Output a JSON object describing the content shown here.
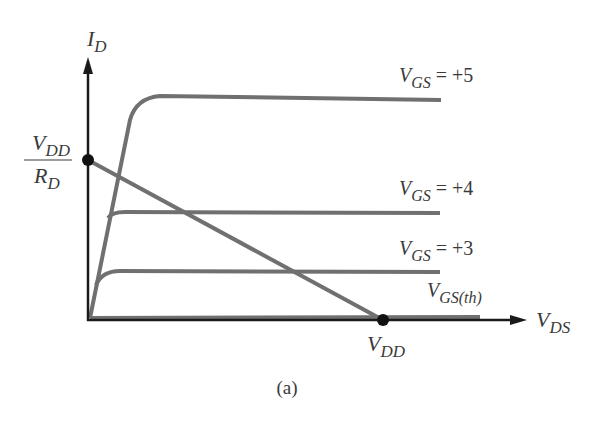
{
  "figure": {
    "caption": "(a)",
    "axes": {
      "y_label": {
        "main": "I",
        "sub": "D"
      },
      "x_label": {
        "main": "V",
        "sub": "DS"
      }
    },
    "load_line": {
      "y_intercept_label": {
        "num_main": "V",
        "num_sub": "DD",
        "den_main": "R",
        "den_sub": "D"
      },
      "x_intercept_label": {
        "main": "V",
        "sub": "DD"
      }
    },
    "curves": [
      {
        "main": "V",
        "sub": "GS",
        "eq": " = +5"
      },
      {
        "main": "V",
        "sub": "GS",
        "eq": " = +4"
      },
      {
        "main": "V",
        "sub": "GS",
        "eq": " = +3"
      },
      {
        "main": "V",
        "sub": "GS(th)",
        "eq": ""
      }
    ],
    "colors": {
      "curve": "#707070",
      "axis": "#1a1a1a",
      "text": "#3a3a3a"
    }
  }
}
